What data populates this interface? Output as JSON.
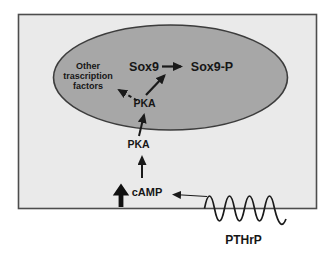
{
  "figure": {
    "type": "cell-signaling-pathway-diagram",
    "colors": {
      "background": "#ffffff",
      "cell_fill": "#eaeaea",
      "cell_border": "#4d4d4d",
      "nucleus_fill": "#a7a7a7",
      "nucleus_border": "#3c3c3c",
      "line": "#1a1a1a",
      "text": "#161616"
    },
    "nucleus": {
      "labels": {
        "other_factors": [
          "Other",
          "trascription",
          "factors"
        ],
        "sox9": "Sox9",
        "sox9_p": "Sox9-P",
        "pka": "PKA"
      }
    },
    "cytoplasm": {
      "labels": {
        "pka": "PKA",
        "camp": "cAMP"
      }
    },
    "extracellular": {
      "receptor_ligand_label": "PTHrP"
    }
  }
}
